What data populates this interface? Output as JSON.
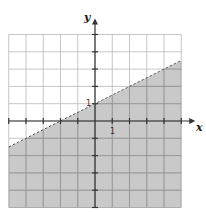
{
  "chart_data": {
    "type": "line",
    "title": "",
    "xlabel": "x",
    "ylabel": "y",
    "xlim": [
      -5,
      5
    ],
    "ylim": [
      -5,
      5
    ],
    "grid": true,
    "grid_step": 1,
    "tick_labels": {
      "x": [
        "1"
      ],
      "y": [
        "1"
      ]
    },
    "series": [
      {
        "name": "boundary line",
        "equation": "y = 0.5x + 1",
        "slope": 0.5,
        "intercept": 1,
        "style": "dashed",
        "x": [
          -5,
          5
        ],
        "y": [
          -1.5,
          3.5
        ]
      }
    ],
    "shaded_region": {
      "inequality": "y < 0.5x + 1",
      "side": "below",
      "boundary_inclusive": false
    },
    "legend": null
  },
  "labels": {
    "x_axis": "x",
    "y_axis": "y",
    "x_tick_one": "1",
    "y_tick_one": "1"
  },
  "colors": {
    "shade": "#c9c9c9",
    "grid": "#b8b8b8",
    "grid_shaded": "#8f8f8f",
    "axis": "#333333",
    "boundary": "#555555",
    "background": "#ffffff"
  },
  "layout": {
    "origin_px": [
      95,
      121
    ],
    "unit_px_x": 17.25,
    "unit_px_y": 17.3
  }
}
